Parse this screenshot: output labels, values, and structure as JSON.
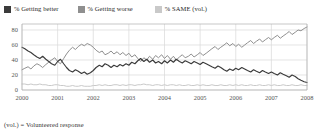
{
  "legend": {
    "items": [
      {
        "label": "% Getting better",
        "color": "#3b3b3b",
        "icon": "legend-swatch-icon"
      },
      {
        "label": "% Getting worse",
        "color": "#8f8f8f",
        "icon": "legend-swatch-icon"
      },
      {
        "label": "% SAME  (vol.)",
        "color": "#c9c9c9",
        "icon": "legend-swatch-icon"
      }
    ]
  },
  "footnote": "(vol.) = Volunteered response",
  "chart_data": {
    "type": "line",
    "title": "",
    "subtitle": "",
    "xlabel": "",
    "ylabel": "",
    "xlim": [
      2000,
      2008
    ],
    "ylim": [
      0,
      88
    ],
    "yticks": [
      0,
      20,
      40,
      60,
      80
    ],
    "xticks": [
      2000,
      2001,
      2002,
      2003,
      2004,
      2005,
      2006,
      2007,
      2008
    ],
    "xticklabels": [
      "2000",
      "2001",
      "2002",
      "2003",
      "2004",
      "2005",
      "2006",
      "2007",
      "2008"
    ],
    "yticklabels": [
      "0",
      "20",
      "40",
      "60",
      "80"
    ],
    "grid": true,
    "grid_axis": "y",
    "legend_position": "top",
    "colors": {
      "getting_better": "#3b3b3b",
      "getting_worse": "#8f8f8f",
      "same": "#c9c9c9",
      "grid": "#d8d8d8",
      "axis": "#b0b0b0",
      "tick_label": "#555555"
    },
    "x": [
      2000.0,
      2000.08,
      2000.17,
      2000.25,
      2000.33,
      2000.42,
      2000.5,
      2000.58,
      2000.67,
      2000.75,
      2000.83,
      2000.92,
      2001.0,
      2001.08,
      2001.17,
      2001.25,
      2001.33,
      2001.42,
      2001.5,
      2001.58,
      2001.67,
      2001.75,
      2001.83,
      2001.92,
      2002.0,
      2002.08,
      2002.17,
      2002.25,
      2002.33,
      2002.42,
      2002.5,
      2002.58,
      2002.67,
      2002.75,
      2002.83,
      2002.92,
      2003.0,
      2003.08,
      2003.17,
      2003.25,
      2003.33,
      2003.42,
      2003.5,
      2003.58,
      2003.67,
      2003.75,
      2003.83,
      2003.92,
      2004.0,
      2004.08,
      2004.17,
      2004.25,
      2004.33,
      2004.42,
      2004.5,
      2004.58,
      2004.67,
      2004.75,
      2004.83,
      2004.92,
      2005.0,
      2005.08,
      2005.17,
      2005.25,
      2005.33,
      2005.42,
      2005.5,
      2005.58,
      2005.67,
      2005.75,
      2005.83,
      2005.92,
      2006.0,
      2006.08,
      2006.17,
      2006.25,
      2006.33,
      2006.42,
      2006.5,
      2006.58,
      2006.67,
      2006.75,
      2006.83,
      2006.92,
      2007.0,
      2007.08,
      2007.17,
      2007.25,
      2007.33,
      2007.42,
      2007.5,
      2007.58,
      2007.67,
      2007.75,
      2007.83,
      2007.92,
      2008.0
    ],
    "series": [
      {
        "name": "% Getting better",
        "color": "#3b3b3b",
        "values": [
          57,
          55,
          52,
          50,
          47,
          44,
          42,
          45,
          41,
          38,
          35,
          33,
          38,
          41,
          35,
          30,
          26,
          24,
          27,
          25,
          22,
          24,
          21,
          23,
          26,
          30,
          33,
          31,
          35,
          33,
          30,
          33,
          31,
          34,
          32,
          35,
          33,
          37,
          35,
          39,
          42,
          38,
          41,
          37,
          40,
          36,
          38,
          35,
          39,
          36,
          40,
          37,
          41,
          38,
          36,
          39,
          37,
          35,
          38,
          36,
          34,
          37,
          35,
          33,
          31,
          29,
          32,
          30,
          27,
          25,
          28,
          26,
          29,
          27,
          30,
          28,
          26,
          24,
          27,
          25,
          23,
          26,
          24,
          22,
          24,
          22,
          20,
          23,
          21,
          19,
          17,
          20,
          18,
          15,
          13,
          11,
          10
        ]
      },
      {
        "name": "% Getting worse",
        "color": "#8f8f8f",
        "values": [
          27,
          29,
          31,
          28,
          32,
          35,
          33,
          30,
          34,
          37,
          40,
          43,
          38,
          35,
          42,
          48,
          53,
          57,
          54,
          58,
          61,
          59,
          62,
          60,
          57,
          53,
          50,
          52,
          47,
          49,
          52,
          48,
          51,
          47,
          50,
          46,
          49,
          44,
          47,
          42,
          38,
          43,
          40,
          45,
          41,
          46,
          43,
          47,
          42,
          46,
          41,
          45,
          40,
          44,
          47,
          43,
          45,
          48,
          44,
          47,
          50,
          46,
          49,
          52,
          55,
          58,
          54,
          57,
          60,
          63,
          59,
          62,
          58,
          61,
          57,
          60,
          63,
          66,
          62,
          65,
          68,
          64,
          67,
          70,
          67,
          70,
          73,
          69,
          72,
          75,
          78,
          74,
          77,
          80,
          79,
          82,
          84
        ]
      },
      {
        "name": "% SAME  (vol.)",
        "color": "#c9c9c9",
        "values": [
          8,
          8,
          7,
          8,
          7,
          7,
          8,
          7,
          7,
          6,
          6,
          7,
          7,
          6,
          6,
          5,
          5,
          6,
          5,
          5,
          6,
          5,
          5,
          5,
          6,
          6,
          7,
          6,
          7,
          6,
          6,
          7,
          7,
          6,
          7,
          6,
          7,
          7,
          6,
          7,
          7,
          8,
          7,
          7,
          6,
          7,
          7,
          6,
          7,
          6,
          7,
          7,
          6,
          7,
          6,
          6,
          7,
          6,
          6,
          7,
          6,
          7,
          6,
          6,
          7,
          6,
          6,
          7,
          6,
          6,
          7,
          6,
          7,
          6,
          7,
          6,
          6,
          7,
          6,
          6,
          7,
          6,
          6,
          7,
          6,
          7,
          6,
          6,
          7,
          6,
          6,
          7,
          6,
          6,
          7,
          6,
          6
        ]
      }
    ]
  }
}
